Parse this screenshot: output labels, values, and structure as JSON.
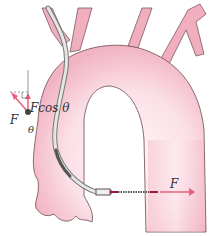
{
  "diagram": {
    "labels": {
      "force_main": "F",
      "force_component": "Fcos θ",
      "angle": "θ",
      "force_output": "F"
    },
    "colors": {
      "vessel_fill": "#f2b8c6",
      "vessel_inner": "#fde9ee",
      "vessel_outline": "#7a5a60",
      "arrow": "#e8607a",
      "catheter": "#888888",
      "guide_line": "#555555"
    }
  }
}
